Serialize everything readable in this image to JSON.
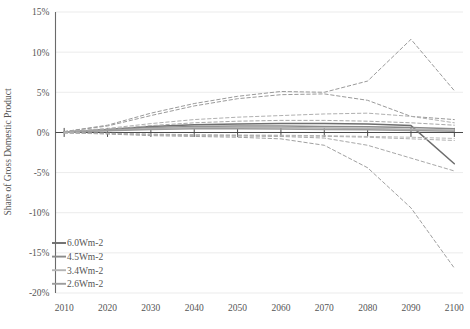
{
  "chart_data": {
    "type": "line",
    "title": "",
    "xlabel": "",
    "ylabel": "Share of Gross Domestic Product",
    "xlim": [
      2005,
      2105
    ],
    "ylim": [
      -20,
      15
    ],
    "xticks": [
      2010,
      2020,
      2030,
      2040,
      2050,
      2060,
      2070,
      2080,
      2090,
      2100
    ],
    "yticks": [
      15,
      10,
      5,
      0,
      -5,
      -10,
      -15,
      -20
    ],
    "ytick_labels": [
      "15%",
      "10%",
      "5%",
      "0%",
      "-5%",
      "-10%",
      "-15%",
      "-20%"
    ],
    "xtick_labels": [
      "2010",
      "2020",
      "2030",
      "2040",
      "2050",
      "2060",
      "2070",
      "2080",
      "2090",
      "2100"
    ],
    "grid": true,
    "legend_position": "lower-left",
    "x": [
      2010,
      2020,
      2030,
      2040,
      2050,
      2060,
      2070,
      2080,
      2090,
      2100
    ],
    "series": [
      {
        "name": "6.0Wm-2",
        "color": "#6d6d6d",
        "style": "solid",
        "values": [
          0.05,
          0.35,
          0.75,
          0.95,
          1.05,
          1.1,
          1.1,
          1.05,
          0.85,
          -3.9
        ]
      },
      {
        "name": "4.5Wm-2",
        "color": "#8a8a8a",
        "style": "solid",
        "values": [
          0.05,
          0.3,
          0.6,
          0.75,
          0.8,
          0.8,
          0.75,
          0.7,
          0.6,
          0.45
        ]
      },
      {
        "name": "3.4Wm-2",
        "color": "#b4b4b4",
        "style": "solid",
        "values": [
          0.05,
          0.25,
          0.5,
          0.6,
          0.62,
          0.6,
          0.55,
          0.5,
          0.4,
          0.3
        ]
      },
      {
        "name": "2.6Wm-2",
        "color": "#9c9c9c",
        "style": "solid",
        "values": [
          0.05,
          0.2,
          0.38,
          0.45,
          0.45,
          0.42,
          0.38,
          0.32,
          0.25,
          0.15
        ]
      },
      {
        "name": "6.0Wm-2 upper",
        "color": "#9a9a9a",
        "style": "dashed",
        "values": [
          0.1,
          0.9,
          2.4,
          3.6,
          4.5,
          5.1,
          5.0,
          6.4,
          11.6,
          5.2
        ]
      },
      {
        "name": "4.5Wm-2 upper",
        "color": "#9a9a9a",
        "style": "dashed",
        "values": [
          0.1,
          0.8,
          2.1,
          3.3,
          4.2,
          4.7,
          4.8,
          4.0,
          2.0,
          1.6
        ]
      },
      {
        "name": "3.4Wm-2 upper",
        "color": "#b0b0b0",
        "style": "dashed",
        "values": [
          0.1,
          0.5,
          1.1,
          1.6,
          1.9,
          2.1,
          2.3,
          2.4,
          2.0,
          1.2
        ]
      },
      {
        "name": "2.6Wm-2 upper",
        "color": "#a8a8a8",
        "style": "dashed",
        "values": [
          0.08,
          0.4,
          0.85,
          1.2,
          1.4,
          1.5,
          1.5,
          1.4,
          1.2,
          0.9
        ]
      },
      {
        "name": "6.0Wm-2 lower",
        "color": "#a0a0a0",
        "style": "dashed",
        "values": [
          -0.05,
          -0.2,
          -0.4,
          -0.5,
          -0.6,
          -0.8,
          -1.6,
          -4.4,
          -9.4,
          -16.9
        ]
      },
      {
        "name": "4.5Wm-2 lower",
        "color": "#a8a8a8",
        "style": "dashed",
        "values": [
          -0.05,
          -0.15,
          -0.3,
          -0.4,
          -0.45,
          -0.5,
          -0.7,
          -1.6,
          -3.2,
          -4.8
        ]
      },
      {
        "name": "3.4Wm-2 lower",
        "color": "#b8b8b8",
        "style": "dashed",
        "values": [
          -0.05,
          -0.1,
          -0.2,
          -0.28,
          -0.32,
          -0.35,
          -0.4,
          -0.5,
          -0.6,
          -0.75
        ]
      },
      {
        "name": "2.6Wm-2 lower",
        "color": "#b0b0b0",
        "style": "dashed",
        "values": [
          -0.05,
          -0.12,
          -0.25,
          -0.33,
          -0.38,
          -0.42,
          -0.48,
          -0.6,
          -0.8,
          -1.0
        ]
      }
    ]
  },
  "legend": {
    "items": [
      {
        "label": "6.0Wm-2",
        "color": "#6d6d6d"
      },
      {
        "label": "4.5Wm-2",
        "color": "#8a8a8a"
      },
      {
        "label": "3.4Wm-2",
        "color": "#b4b4b4"
      },
      {
        "label": "2.6Wm-2",
        "color": "#9c9c9c"
      }
    ]
  },
  "axes": {
    "y_axis_title": "Share of Gross Domestic Product"
  }
}
